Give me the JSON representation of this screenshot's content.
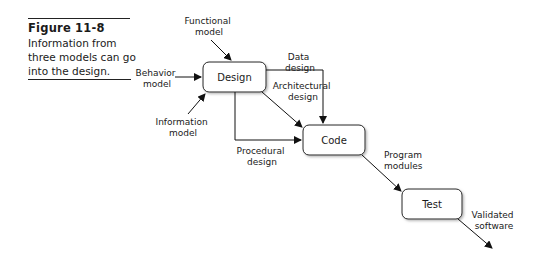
{
  "caption": {
    "figure_label": "Figure 11-8",
    "description": "Information from three models can go into the design."
  },
  "boxes": {
    "design": "Design",
    "code": "Code",
    "test": "Test"
  },
  "inputs": {
    "functional": [
      "Functional",
      "model"
    ],
    "behavior": [
      "Behavior",
      "model"
    ],
    "information": [
      "Information",
      "model"
    ]
  },
  "flows": {
    "data_design": [
      "Data",
      "design"
    ],
    "architectural_design": [
      "Architectural",
      "design"
    ],
    "procedural_design": [
      "Procedural",
      "design"
    ],
    "program_modules": [
      "Program",
      "modules"
    ],
    "validated_software": [
      "Validated",
      "software"
    ]
  }
}
